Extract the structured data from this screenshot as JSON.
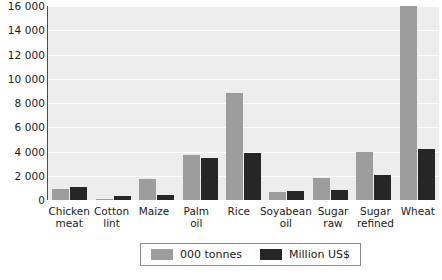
{
  "chart_data": {
    "type": "bar",
    "title": "",
    "subtitle": "",
    "xlabel": "",
    "ylabel": "",
    "ylim": [
      0,
      16000
    ],
    "ytick_values": [
      0,
      2000,
      4000,
      6000,
      8000,
      10000,
      12000,
      14000,
      16000
    ],
    "ytick_labels": [
      "0",
      "2 000",
      "4 000",
      "6 000",
      "8 000",
      "10 000",
      "12 000",
      "14 000",
      "16 000"
    ],
    "grid": true,
    "legend_position": "bottom",
    "categories": [
      "Chicken\nmeat",
      "Cotton\nlint",
      "Maize",
      "Palm\noil",
      "Rice",
      "Soyabean\noil",
      "Sugar\nraw",
      "Sugar\nrefined",
      "Wheat"
    ],
    "series": [
      {
        "name": "000 tonnes",
        "color": "#9d9d9d",
        "values": [
          900,
          120,
          1700,
          3700,
          8800,
          650,
          1850,
          4000,
          16000
        ]
      },
      {
        "name": "Million US$",
        "color": "#262626",
        "values": [
          1050,
          350,
          400,
          3500,
          3900,
          750,
          850,
          2100,
          4200
        ]
      }
    ]
  },
  "legend": {
    "items": [
      {
        "label": "000 tonnes",
        "swatch": "#9d9d9d"
      },
      {
        "label": "Million US$",
        "swatch": "#262626"
      }
    ]
  },
  "colors": {
    "plot_background": "#ededed",
    "gridline": "#ffffff",
    "axis": "#4d4d4d",
    "series_tonnes": "#9d9d9d",
    "series_usd": "#262626",
    "text": "#1a1a1a"
  }
}
